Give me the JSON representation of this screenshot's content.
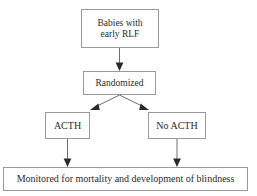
{
  "diagram": {
    "background_color": "#ffffff",
    "box_border_color": "#9a9a9a",
    "line_color": "#6e6e6e",
    "arrowhead_color": "#2a2a2a",
    "text_color": "#2b2b2b",
    "nodes": [
      {
        "id": "babies",
        "label": "Babies with\nearly RLF",
        "line1": "Babies with",
        "line2": "early RLF"
      },
      {
        "id": "randomized",
        "label": "Randomized"
      },
      {
        "id": "acth",
        "label": "ACTH"
      },
      {
        "id": "no_acth",
        "label": "No ACTH"
      },
      {
        "id": "monitored",
        "label": "Monitored for mortality and development of blindness"
      }
    ],
    "edges": [
      {
        "id": "babies-to-randomized",
        "from": "babies",
        "to": "randomized",
        "arrow": true
      },
      {
        "id": "randomized-to-acth",
        "from": "randomized",
        "to": "acth",
        "arrow": true
      },
      {
        "id": "randomized-to-no-acth",
        "from": "randomized",
        "to": "no_acth",
        "arrow": true
      },
      {
        "id": "acth-to-monitored",
        "from": "acth",
        "to": "monitored",
        "arrow": true
      },
      {
        "id": "no-acth-to-monitored",
        "from": "no_acth",
        "to": "monitored",
        "arrow": true
      }
    ]
  }
}
